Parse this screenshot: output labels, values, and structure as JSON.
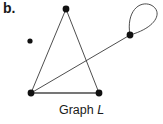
{
  "figure": {
    "part_label": "b.",
    "caption_prefix": "Graph",
    "caption_name": "L",
    "width": 163,
    "height": 124,
    "background_color": "#ffffff",
    "stroke_color": "#3a3a3a",
    "vertex_color": "#111111"
  },
  "graph": {
    "name": "L",
    "vertex_count": 5,
    "edge_count": 5,
    "vertices": [
      {
        "id": "v_isolated",
        "label": "",
        "x": 30,
        "y": 41,
        "r": 2.6,
        "degree": 0
      },
      {
        "id": "v_top",
        "label": "",
        "x": 66,
        "y": 9,
        "r": 3.4,
        "degree": 2
      },
      {
        "id": "v_left",
        "label": "",
        "x": 31,
        "y": 93,
        "r": 3.4,
        "degree": 3
      },
      {
        "id": "v_right",
        "label": "",
        "x": 99,
        "y": 93,
        "r": 3.4,
        "degree": 2
      },
      {
        "id": "v_loop",
        "label": "",
        "x": 130,
        "y": 35,
        "r": 3.4,
        "degree": 3
      }
    ],
    "edges": [
      {
        "id": "e_top_left",
        "from": "v_top",
        "to": "v_left",
        "type": "line",
        "width": 0.9
      },
      {
        "id": "e_top_right",
        "from": "v_top",
        "to": "v_right",
        "type": "line",
        "width": 0.9
      },
      {
        "id": "e_left_right",
        "from": "v_left",
        "to": "v_right",
        "type": "line",
        "width": 1.7
      },
      {
        "id": "e_left_loopvertex",
        "from": "v_left",
        "to": "v_loop",
        "type": "line",
        "width": 0.9
      },
      {
        "id": "e_self_loop",
        "from": "v_loop",
        "to": "v_loop",
        "type": "self-loop",
        "width": 0.9,
        "path": "M130,35 C128,10 140,0 151,5 C162,10 160,26 130,35 Z"
      }
    ]
  }
}
